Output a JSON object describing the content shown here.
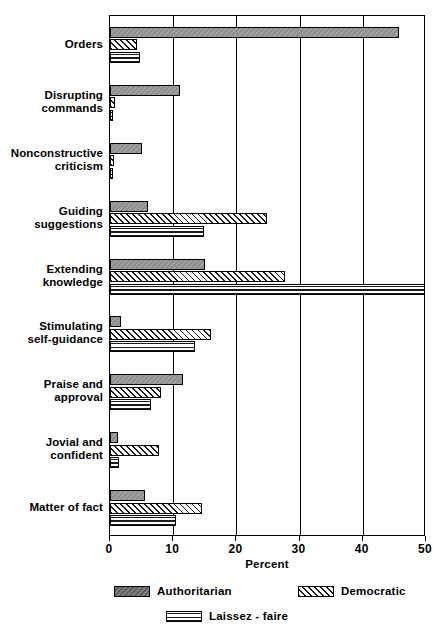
{
  "chart_data": {
    "type": "bar",
    "orientation": "horizontal",
    "title": "",
    "xlabel": "Percent",
    "ylabel": "",
    "xlim": [
      0,
      50
    ],
    "xticks": [
      0,
      10,
      20,
      30,
      40,
      50
    ],
    "grid": true,
    "grid_axis": "x",
    "legend_position": "bottom",
    "categories": [
      "Orders",
      "Disrupting commands",
      "Nonconstructive criticism",
      "Guiding suggestions",
      "Extending knowledge",
      "Stimulating self-guidance",
      "Praise and approval",
      "Jovial and confident",
      "Matter of fact"
    ],
    "category_lines": [
      [
        "Orders"
      ],
      [
        "Disrupting",
        "commands"
      ],
      [
        "Nonconstructive",
        "criticism"
      ],
      [
        "Guiding",
        "suggestions"
      ],
      [
        "Extending",
        "knowledge"
      ],
      [
        "Stimulating",
        "self-guidance"
      ],
      [
        "Praise and",
        "approval"
      ],
      [
        "Jovial and",
        "confident"
      ],
      [
        "Matter of fact"
      ]
    ],
    "series": [
      {
        "name": "Authoritarian",
        "key": "auth",
        "pattern": "solid-gray",
        "color": "#8a8a8a",
        "values": [
          45.7,
          11.0,
          5.0,
          6.0,
          15.0,
          1.8,
          11.5,
          1.2,
          5.5
        ]
      },
      {
        "name": "Democratic",
        "key": "dem",
        "pattern": "diagonal-hatch",
        "color": "#ffffff",
        "values": [
          4.2,
          0.8,
          0.7,
          24.8,
          27.7,
          16.0,
          8.0,
          7.8,
          14.5
        ]
      },
      {
        "name": "Laissez - faire",
        "key": "laissez",
        "pattern": "horizontal-lines",
        "color": "#ffffff",
        "values": [
          4.8,
          0.5,
          0.5,
          14.8,
          49.8,
          13.5,
          6.5,
          1.5,
          10.5
        ]
      }
    ]
  },
  "axis": {
    "tick_labels": [
      "0",
      "10",
      "20",
      "30",
      "40",
      "50"
    ],
    "x_title": "Percent"
  },
  "legend": {
    "items": [
      {
        "label": "Authoritarian"
      },
      {
        "label": "Democratic"
      },
      {
        "label": "Laissez - faire"
      }
    ]
  }
}
